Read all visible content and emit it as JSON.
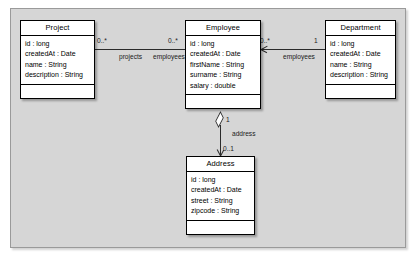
{
  "diagram": {
    "type": "uml-class-diagram",
    "classes": [
      {
        "id": "project",
        "name": "Project",
        "attributes": [
          "id : long",
          "createdAt : Date",
          "name : String",
          "description : String"
        ],
        "operations": []
      },
      {
        "id": "employee",
        "name": "Employee",
        "attributes": [
          "id : long",
          "createdAt : Date",
          "firstName : String",
          "surname : String",
          "salary : double"
        ],
        "operations": []
      },
      {
        "id": "department",
        "name": "Department",
        "attributes": [
          "id : long",
          "createdAt : Date",
          "name : String",
          "description : String"
        ],
        "operations": []
      },
      {
        "id": "address",
        "name": "Address",
        "attributes": [
          "id : long",
          "createdAt : Date",
          "street : String",
          "zipcode : String"
        ],
        "operations": []
      }
    ],
    "associations": [
      {
        "id": "project-employee",
        "source": "Project",
        "target": "Employee",
        "source_multiplicity": "0..*",
        "target_multiplicity": "0..*",
        "source_role": "projects",
        "target_role": "employees",
        "kind": "association"
      },
      {
        "id": "employee-department",
        "source": "Employee",
        "target": "Department",
        "source_multiplicity": "0..*",
        "target_multiplicity": "1",
        "source_role": "employees",
        "kind": "directed-association"
      },
      {
        "id": "employee-address",
        "source": "Employee",
        "target": "Address",
        "source_multiplicity": "1",
        "target_multiplicity": "0..1",
        "target_role": "address",
        "kind": "aggregation"
      }
    ],
    "labels": {
      "mult_project_left": "0..*",
      "mult_project_right": "0..*",
      "role_projects": "projects",
      "role_employees_left": "employees",
      "mult_emp_dept_left": "0..*",
      "mult_emp_dept_right": "1",
      "role_employees_right": "employees",
      "mult_address_top": "1",
      "role_address": "address",
      "mult_address_bottom": "0..1"
    },
    "colors": {
      "canvas": "#d6d6d6",
      "class_fill": "#ffffff",
      "stroke": "#000000",
      "line": "#2b2b2b"
    }
  }
}
